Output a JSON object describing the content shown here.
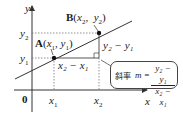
{
  "diagram": {
    "axes": {
      "x_label": "x",
      "y_label": "y",
      "origin_label": "0"
    },
    "ticks": {
      "x1": "x",
      "x1_sub": "1",
      "x2": "x",
      "x2_sub": "2",
      "y1": "y",
      "y1_sub": "1",
      "y2": "y",
      "y2_sub": "2"
    },
    "points": {
      "A": {
        "name": "A",
        "open": "(",
        "x": "x",
        "x_sub": "1",
        "sep": ",",
        "y": "y",
        "y_sub": "1",
        "close": ")"
      },
      "B": {
        "name": "B",
        "open": "(",
        "x": "x",
        "x_sub": "2",
        "sep": ",",
        "y": "y",
        "y_sub": "2",
        "close": ")"
      }
    },
    "run_label": "x₂ − x₁",
    "rise_label": "y₂ − y₁",
    "formula": {
      "caption": "斜率",
      "var": "m =",
      "numerator": "y₂ − y₁",
      "denominator": "x₂ − x₁"
    },
    "colors": {
      "line": "#333333",
      "dashed": "#666666",
      "axis": "#333333",
      "box_border": "#444444"
    }
  }
}
